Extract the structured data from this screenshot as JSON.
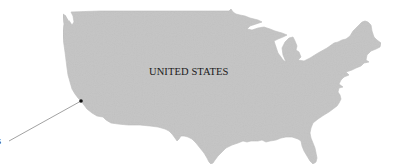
{
  "map": {
    "country_label": "UNITED STATES",
    "callout": {
      "label_visible_fragment": "s",
      "marker": {
        "x": 81,
        "y": 101
      },
      "line_end": {
        "x": 9,
        "y": 141
      }
    },
    "colors": {
      "land": "#c4c4c4",
      "land_stroke": "#b8b8b8",
      "water": "#ffffff",
      "marker": "#111111",
      "callout_line": "#8a8a8a",
      "text": "#1a1a1a"
    }
  }
}
